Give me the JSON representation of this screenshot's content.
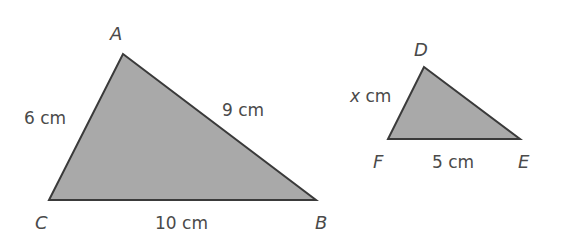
{
  "figure": {
    "fill_color": "#a9a9a9",
    "stroke_color": "#3a3a3a",
    "text_color": "#4a4a4a",
    "triangle_abc": {
      "vertices": {
        "A": "A",
        "B": "B",
        "C": "C"
      },
      "sides": {
        "AC": "6 cm",
        "AB": "9 cm",
        "CB": "10 cm"
      }
    },
    "triangle_def": {
      "vertices": {
        "D": "D",
        "E": "E",
        "F": "F"
      },
      "sides": {
        "DF_var": "x",
        "DF_unit": " cm",
        "FE": "5 cm"
      }
    }
  }
}
